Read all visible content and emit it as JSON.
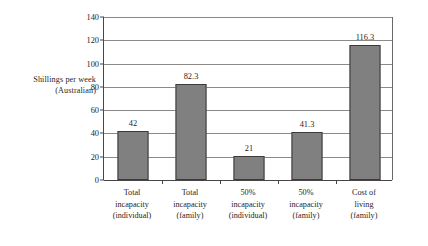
{
  "chart_data": {
    "type": "bar",
    "title": "",
    "xlabel": "",
    "ylabel": "Shillings per week (Australian)",
    "ylabel_lines": [
      "Shillings per week",
      "(Australian)"
    ],
    "categories": [
      "Total incapacity (individual)",
      "Total incapacity (family)",
      "50% incapacity (individual)",
      "50% incapacity (family)",
      "Cost of living (family)"
    ],
    "category_lines": [
      [
        "Total",
        "incapacity",
        "(individual)"
      ],
      [
        "Total",
        "incapacity",
        "(family)"
      ],
      [
        "50%",
        "incapacity",
        "(individual)"
      ],
      [
        "50%",
        "incapacity",
        "(family)"
      ],
      [
        "Cost of",
        "living",
        "(family)"
      ]
    ],
    "values": [
      42,
      82.3,
      21,
      41.3,
      116.3
    ],
    "value_labels": [
      "42",
      "82.3",
      "21",
      "41.3",
      "116.3"
    ],
    "ylim": [
      0,
      140
    ],
    "yticks": [
      0,
      20,
      40,
      60,
      80,
      100,
      120,
      140
    ],
    "ytick_labels": [
      "0",
      "20",
      "40",
      "60",
      "80",
      "100",
      "120",
      "140"
    ],
    "grid": true,
    "legend": false,
    "bar_color": "#808080",
    "bar_border_color": "#3d3939",
    "gridline_color": "#8d8989",
    "axis_color": "#4a4646",
    "background": "#ffffff"
  }
}
